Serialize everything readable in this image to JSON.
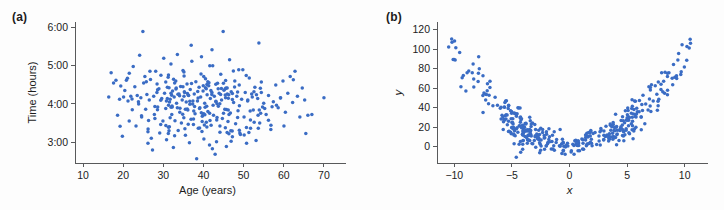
{
  "figure": {
    "background_color": "#fdfdfd",
    "marker_color": "#3a6cc4",
    "axis_color": "#58595b",
    "text_color": "#1c1c1c"
  },
  "panels": [
    {
      "label": "(a)",
      "name": "panel-a"
    },
    {
      "label": "(b)",
      "name": "panel-b"
    }
  ],
  "chart_data": [
    {
      "type": "scatter",
      "panel": "(a)",
      "title": "",
      "xlabel": "Age (years)",
      "ylabel": "Time (hours)",
      "xlim": [
        8,
        74
      ],
      "ylim": [
        2.45,
        6.15
      ],
      "xticks": [
        10,
        20,
        30,
        40,
        50,
        60,
        70
      ],
      "xticklabels": [
        "10",
        "20",
        "30",
        "40",
        "50",
        "60",
        "70"
      ],
      "yticks": [
        3,
        4,
        5,
        6
      ],
      "yticklabels": [
        "3:00",
        "4:00",
        "5:00",
        "6:00"
      ],
      "grid": false,
      "legend": "none",
      "n_points": 330,
      "description": "Uncorrelated cloud of marathon finish times versus runner age; centered near age 39 and time 3:55, no visible trend.",
      "x_center": 39.0,
      "x_spread": 9.0,
      "y_center": 3.93,
      "y_spread": 0.52,
      "correlation": -0.02,
      "points": [
        [
          16.4,
          4.18
        ],
        [
          17.0,
          4.82
        ],
        [
          17.6,
          4.55
        ],
        [
          18.2,
          4.62
        ],
        [
          18.6,
          3.7
        ],
        [
          19.1,
          4.12
        ],
        [
          19.4,
          4.47
        ],
        [
          19.8,
          3.15
        ],
        [
          20.1,
          4.18
        ],
        [
          20.4,
          4.35
        ],
        [
          20.8,
          4.62
        ],
        [
          21.2,
          4.08
        ],
        [
          21.5,
          3.55
        ],
        [
          21.9,
          4.2
        ],
        [
          22.2,
          4.13
        ],
        [
          22.5,
          4.98
        ],
        [
          22.9,
          4.45
        ],
        [
          23.2,
          3.42
        ],
        [
          23.5,
          4.22
        ],
        [
          23.8,
          4.06
        ],
        [
          24.1,
          5.28
        ],
        [
          24.4,
          4.16
        ],
        [
          24.6,
          3.66
        ],
        [
          24.9,
          5.9
        ],
        [
          25.1,
          4.55
        ],
        [
          25.4,
          4.72
        ],
        [
          25.6,
          3.86
        ],
        [
          25.9,
          4.25
        ],
        [
          26.2,
          3.34
        ],
        [
          26.5,
          4.1
        ],
        [
          26.8,
          4.64
        ],
        [
          27.0,
          3.1
        ],
        [
          27.3,
          2.79
        ],
        [
          27.6,
          4.2
        ],
        [
          27.9,
          3.62
        ],
        [
          28.1,
          4.86
        ],
        [
          28.4,
          4.3
        ],
        [
          28.6,
          3.92
        ],
        [
          28.9,
          4.4
        ],
        [
          29.1,
          3.24
        ],
        [
          29.4,
          4.75
        ],
        [
          29.6,
          4.14
        ],
        [
          29.9,
          3.55
        ],
        [
          30.1,
          5.2
        ],
        [
          30.3,
          4.28
        ],
        [
          30.6,
          3.88
        ],
        [
          30.8,
          3.06
        ],
        [
          31.0,
          4.44
        ],
        [
          31.2,
          4.7
        ],
        [
          31.5,
          3.4
        ],
        [
          31.7,
          4.12
        ],
        [
          31.9,
          5.05
        ],
        [
          32.1,
          3.72
        ],
        [
          32.3,
          4.34
        ],
        [
          32.5,
          2.86
        ],
        [
          32.7,
          4.18
        ],
        [
          32.9,
          3.56
        ],
        [
          33.1,
          4.6
        ],
        [
          33.3,
          4.02
        ],
        [
          33.5,
          5.3
        ],
        [
          33.7,
          3.3
        ],
        [
          33.9,
          4.26
        ],
        [
          34.1,
          3.78
        ],
        [
          34.3,
          4.46
        ],
        [
          34.5,
          3.5
        ],
        [
          34.7,
          4.1
        ],
        [
          34.9,
          4.88
        ],
        [
          35.1,
          3.64
        ],
        [
          35.3,
          4.3
        ],
        [
          35.5,
          3.18
        ],
        [
          35.7,
          4.05
        ],
        [
          35.9,
          4.52
        ],
        [
          36.1,
          3.84
        ],
        [
          36.3,
          4.22
        ],
        [
          36.5,
          2.98
        ],
        [
          36.7,
          4.38
        ],
        [
          36.9,
          3.6
        ],
        [
          37.1,
          5.12
        ],
        [
          37.3,
          4.0
        ],
        [
          37.5,
          3.46
        ],
        [
          37.7,
          4.26
        ],
        [
          37.9,
          3.74
        ],
        [
          38.1,
          4.58
        ],
        [
          38.3,
          2.56
        ],
        [
          38.5,
          4.08
        ],
        [
          38.7,
          3.36
        ],
        [
          38.9,
          4.44
        ],
        [
          39.1,
          3.9
        ],
        [
          39.3,
          4.18
        ],
        [
          39.5,
          5.24
        ],
        [
          39.7,
          3.68
        ],
        [
          39.9,
          4.34
        ],
        [
          40.1,
          3.08
        ],
        [
          40.3,
          4.02
        ],
        [
          40.5,
          4.66
        ],
        [
          40.7,
          3.52
        ],
        [
          40.9,
          4.24
        ],
        [
          41.1,
          3.8
        ],
        [
          41.3,
          4.48
        ],
        [
          41.5,
          2.92
        ],
        [
          41.7,
          4.14
        ],
        [
          41.9,
          3.44
        ],
        [
          42.1,
          4.3
        ],
        [
          42.3,
          5.0
        ],
        [
          42.5,
          3.7
        ],
        [
          42.7,
          4.2
        ],
        [
          42.9,
          2.68
        ],
        [
          43.1,
          4.06
        ],
        [
          43.3,
          3.58
        ],
        [
          43.5,
          4.54
        ],
        [
          43.7,
          3.94
        ],
        [
          43.9,
          4.28
        ],
        [
          44.1,
          3.26
        ],
        [
          44.3,
          4.78
        ],
        [
          44.5,
          4.1
        ],
        [
          44.7,
          3.62
        ],
        [
          44.9,
          5.9
        ],
        [
          45.1,
          4.36
        ],
        [
          45.3,
          3.86
        ],
        [
          45.5,
          4.16
        ],
        [
          45.7,
          2.88
        ],
        [
          45.9,
          4.42
        ],
        [
          46.1,
          3.54
        ],
        [
          46.3,
          4.24
        ],
        [
          46.5,
          5.16
        ],
        [
          46.7,
          3.76
        ],
        [
          46.9,
          4.32
        ],
        [
          47.2,
          3.14
        ],
        [
          47.5,
          4.04
        ],
        [
          47.8,
          4.6
        ],
        [
          48.0,
          3.48
        ],
        [
          48.3,
          4.2
        ],
        [
          48.6,
          3.82
        ],
        [
          48.9,
          4.5
        ],
        [
          49.2,
          3.2
        ],
        [
          49.5,
          4.12
        ],
        [
          49.8,
          4.9
        ],
        [
          50.1,
          3.66
        ],
        [
          50.4,
          4.3
        ],
        [
          50.7,
          3.38
        ],
        [
          51.0,
          4.08
        ],
        [
          51.4,
          4.68
        ],
        [
          51.7,
          3.58
        ],
        [
          52.0,
          4.26
        ],
        [
          52.4,
          3.84
        ],
        [
          52.8,
          4.44
        ],
        [
          53.1,
          3.04
        ],
        [
          53.5,
          4.14
        ],
        [
          53.8,
          5.6
        ],
        [
          54.0,
          3.5
        ],
        [
          54.4,
          4.3
        ],
        [
          55.0,
          4.02
        ],
        [
          55.6,
          3.72
        ],
        [
          56.2,
          4.22
        ],
        [
          56.8,
          3.44
        ],
        [
          57.4,
          4.06
        ],
        [
          58.0,
          4.5
        ],
        [
          58.6,
          3.9
        ],
        [
          59.2,
          4.16
        ],
        [
          59.8,
          4.6
        ],
        [
          60.4,
          3.78
        ],
        [
          61.0,
          4.28
        ],
        [
          61.6,
          4.72
        ],
        [
          62.2,
          4.04
        ],
        [
          62.8,
          4.86
        ],
        [
          63.4,
          4.2
        ],
        [
          64.0,
          3.66
        ],
        [
          64.6,
          4.42
        ],
        [
          65.2,
          4.1
        ],
        [
          66.0,
          3.7
        ],
        [
          67.0,
          3.72
        ],
        [
          70.0,
          4.16
        ]
      ]
    },
    {
      "type": "scatter",
      "panel": "(b)",
      "title": "",
      "xlabel": "x",
      "ylabel": "y",
      "xlim": [
        -11.5,
        11.5
      ],
      "ylim": [
        -17,
        128
      ],
      "xticks": [
        -10,
        -5,
        0,
        5,
        10
      ],
      "xticklabels": [
        "−10",
        "−5",
        "0",
        "5",
        "10"
      ],
      "yticks": [
        0,
        20,
        40,
        60,
        80,
        100,
        120
      ],
      "yticklabels": [
        "0",
        "20",
        "40",
        "60",
        "80",
        "100",
        "120"
      ],
      "grid": false,
      "legend": "none",
      "n_points": 420,
      "description": "Strong quadratic (U-shaped) relation: y rises to about 100 at both x = -10 and x = +10, with a dense minimum near y = 5 around x = 0. Scatter noise widens with |x|.",
      "fit": "y = 0.95 * x^2 + 2",
      "noise_sd": 9,
      "y_at_x_minus10": 97,
      "y_at_x_0": 5,
      "y_at_x_plus10": 97
    }
  ]
}
